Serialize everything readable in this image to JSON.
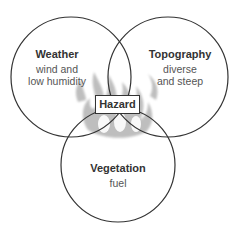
{
  "diagram": {
    "type": "venn",
    "center_label": "Hazard",
    "center_icon": "flame-icon",
    "circles": [
      {
        "title": "Weather",
        "desc": "wind and low humidity",
        "line1": "wind and",
        "line2": "low humidity"
      },
      {
        "title": "Topography",
        "desc": "diverse and steep",
        "line1": "diverse",
        "line2": "and steep"
      },
      {
        "title": "Vegetation",
        "desc": "fuel",
        "line1": "fuel"
      }
    ],
    "colors": {
      "stroke": "#333333",
      "flame": "#9a9a9a",
      "text": "#444444"
    }
  }
}
